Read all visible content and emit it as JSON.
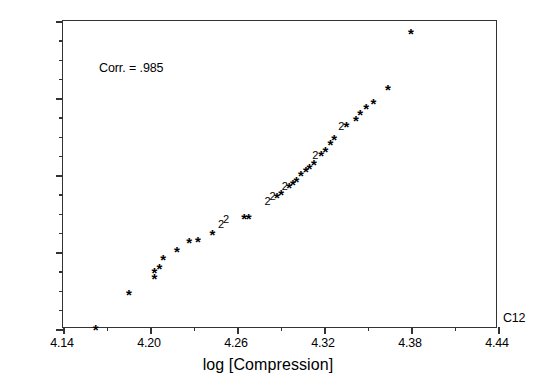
{
  "chart_data": {
    "type": "scatter",
    "title": "",
    "xlabel": "log [Compression]",
    "ylabel": "",
    "series_label": "C12",
    "annotation": "Corr. = .985",
    "correlation": 0.985,
    "xlim": [
      4.14,
      4.44
    ],
    "ylim": [
      -2.4,
      2.4
    ],
    "xticks": [
      "4.14",
      "4.20",
      "4.26",
      "4.32",
      "4.38",
      "4.44"
    ],
    "yticks": [
      "2.40",
      "1.20",
      ".00",
      "-1.20",
      "-2.40"
    ],
    "xtick_values": [
      4.14,
      4.2,
      4.26,
      4.32,
      4.38,
      4.44
    ],
    "ytick_values": [
      2.4,
      1.2,
      0.0,
      -1.2,
      -2.4
    ],
    "minor_ticks_between_x": 1,
    "minor_ticks_between_y": 3,
    "grid": false,
    "legend": "none",
    "marker_symbol": "*",
    "overlap_symbol": "2",
    "points": [
      {
        "x": 4.1625,
        "y": -2.33,
        "m": "*"
      },
      {
        "x": 4.1855,
        "y": -1.79,
        "m": "*"
      },
      {
        "x": 4.203,
        "y": -1.55,
        "m": "*"
      },
      {
        "x": 4.203,
        "y": -1.45,
        "m": "*"
      },
      {
        "x": 4.2065,
        "y": -1.38,
        "m": "*"
      },
      {
        "x": 4.209,
        "y": -1.25,
        "m": "*"
      },
      {
        "x": 4.2185,
        "y": -1.12,
        "m": "*"
      },
      {
        "x": 4.227,
        "y": -0.98,
        "m": "*"
      },
      {
        "x": 4.233,
        "y": -0.97,
        "m": "*"
      },
      {
        "x": 4.243,
        "y": -0.86,
        "m": "*"
      },
      {
        "x": 4.249,
        "y": -0.76,
        "m": "2"
      },
      {
        "x": 4.2525,
        "y": -0.68,
        "m": "2"
      },
      {
        "x": 4.265,
        "y": -0.6,
        "m": "*"
      },
      {
        "x": 4.268,
        "y": -0.6,
        "m": "*"
      },
      {
        "x": 4.281,
        "y": -0.4,
        "m": "2"
      },
      {
        "x": 4.2845,
        "y": -0.33,
        "m": "2"
      },
      {
        "x": 4.2875,
        "y": -0.28,
        "m": "*"
      },
      {
        "x": 4.2905,
        "y": -0.24,
        "m": "*"
      },
      {
        "x": 4.293,
        "y": -0.17,
        "m": "2"
      },
      {
        "x": 4.296,
        "y": -0.12,
        "m": "*"
      },
      {
        "x": 4.2985,
        "y": -0.08,
        "m": "*"
      },
      {
        "x": 4.301,
        "y": -0.03,
        "m": "*"
      },
      {
        "x": 4.304,
        "y": 0.06,
        "m": "*"
      },
      {
        "x": 4.3075,
        "y": 0.12,
        "m": "*"
      },
      {
        "x": 4.31,
        "y": 0.17,
        "m": "*"
      },
      {
        "x": 4.313,
        "y": 0.23,
        "m": "*"
      },
      {
        "x": 4.314,
        "y": 0.31,
        "m": "2"
      },
      {
        "x": 4.318,
        "y": 0.37,
        "m": "*"
      },
      {
        "x": 4.321,
        "y": 0.43,
        "m": "*"
      },
      {
        "x": 4.3245,
        "y": 0.55,
        "m": "*"
      },
      {
        "x": 4.327,
        "y": 0.62,
        "m": "*"
      },
      {
        "x": 4.332,
        "y": 0.76,
        "m": "2"
      },
      {
        "x": 4.3355,
        "y": 0.83,
        "m": "*"
      },
      {
        "x": 4.342,
        "y": 0.92,
        "m": "*"
      },
      {
        "x": 4.345,
        "y": 1.02,
        "m": "*"
      },
      {
        "x": 4.349,
        "y": 1.1,
        "m": "*"
      },
      {
        "x": 4.354,
        "y": 1.19,
        "m": "*"
      },
      {
        "x": 4.364,
        "y": 1.4,
        "m": "*"
      },
      {
        "x": 4.38,
        "y": 2.27,
        "m": "*"
      }
    ]
  }
}
